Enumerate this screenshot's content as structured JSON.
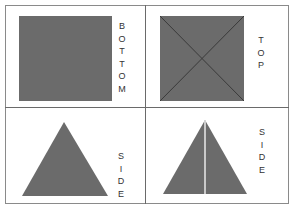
{
  "panels": [
    {
      "id": "bottom",
      "label": "BOTTOM",
      "letters": [
        "B",
        "O",
        "T",
        "T",
        "O",
        "M"
      ],
      "shape": "square"
    },
    {
      "id": "top",
      "label": "TOP",
      "letters": [
        "T",
        "O",
        "P"
      ],
      "shape": "square-with-diagonals"
    },
    {
      "id": "side-left",
      "label": "SIDE",
      "letters": [
        "S",
        "I",
        "D",
        "E"
      ],
      "shape": "triangle"
    },
    {
      "id": "side-right",
      "label": "SIDE",
      "letters": [
        "S",
        "I",
        "D",
        "E"
      ],
      "shape": "triangle-with-center-line"
    }
  ],
  "colors": {
    "fill": "#6b6b6b",
    "border": "#6a6a6a",
    "text": "#333333"
  }
}
